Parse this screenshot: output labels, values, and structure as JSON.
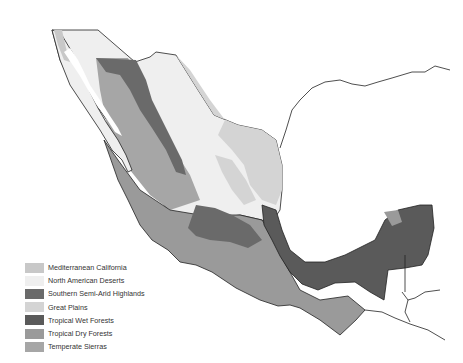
{
  "map": {
    "type": "ecoregion-map",
    "region": "Mexico",
    "style": "grayscale"
  },
  "legend": {
    "items": [
      {
        "label": "Mediterranean California",
        "color": "#c8c8c8"
      },
      {
        "label": "North American Deserts",
        "color": "#efefef"
      },
      {
        "label": "Southern Semi-Arid Highlands",
        "color": "#6a6a6a"
      },
      {
        "label": "Great Plains",
        "color": "#d4d4d4"
      },
      {
        "label": "Tropical Wet Forests",
        "color": "#5a5a5a"
      },
      {
        "label": "Tropical Dry Forests",
        "color": "#9a9a9a"
      },
      {
        "label": "Temperate Sierras",
        "color": "#a6a6a6"
      }
    ]
  }
}
